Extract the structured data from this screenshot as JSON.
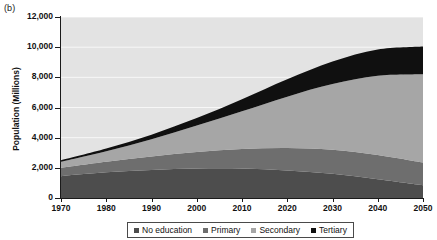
{
  "panel": {
    "label": "(b)"
  },
  "axes": {
    "ylabel": "Population (Millions)",
    "yticks": [
      "0",
      "2,000",
      "4,000",
      "6,000",
      "8,000",
      "10,000",
      "12,000"
    ],
    "xticks": [
      "1970",
      "1980",
      "1990",
      "2000",
      "2010",
      "2020",
      "2030",
      "2040",
      "2050"
    ]
  },
  "legend": {
    "items": [
      {
        "label": "No education",
        "color": "#4d4d4d"
      },
      {
        "label": "Primary",
        "color": "#6e6e6e"
      },
      {
        "label": "Secondary",
        "color": "#a6a6a6"
      },
      {
        "label": "Tertiary",
        "color": "#101010"
      }
    ]
  },
  "colors": {
    "plot_background": "#e3e3e3",
    "gridline": "#f7f7f7",
    "axis": "#1a1a1a",
    "no_education": "#4d4d4d",
    "primary": "#6e6e6e",
    "secondary": "#a6a6a6",
    "tertiary": "#101010"
  },
  "chart_data": {
    "type": "area",
    "stacked": true,
    "title": "",
    "xlabel": "",
    "ylabel": "Population (Millions)",
    "xlim": [
      1970,
      2050
    ],
    "ylim": [
      0,
      12000
    ],
    "ytick_values": [
      0,
      2000,
      4000,
      6000,
      8000,
      10000,
      12000
    ],
    "grid": true,
    "legend_position": "bottom",
    "x": [
      1970,
      1980,
      1990,
      2000,
      2010,
      2020,
      2030,
      2040,
      2050
    ],
    "categories": [
      "1970",
      "1980",
      "1990",
      "2000",
      "2010",
      "2020",
      "2030",
      "2040",
      "2050"
    ],
    "series": [
      {
        "name": "No education",
        "color": "#4d4d4d",
        "values": [
          1450,
          1700,
          1850,
          1950,
          1950,
          1820,
          1600,
          1250,
          850
        ]
      },
      {
        "name": "Primary",
        "color": "#6e6e6e",
        "values": [
          550,
          700,
          900,
          1100,
          1300,
          1500,
          1600,
          1600,
          1500
        ]
      },
      {
        "name": "Secondary",
        "color": "#a6a6a6",
        "values": [
          400,
          700,
          1150,
          1750,
          2500,
          3400,
          4350,
          5250,
          5850
        ]
      },
      {
        "name": "Tertiary",
        "color": "#101010",
        "values": [
          100,
          180,
          300,
          500,
          800,
          1150,
          1500,
          1750,
          1850
        ]
      }
    ],
    "totals": [
      2500,
      3280,
      4200,
      5300,
      6550,
      7870,
      9050,
      9850,
      10050
    ]
  }
}
